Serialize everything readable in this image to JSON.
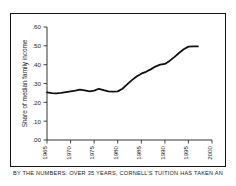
{
  "caption": "BY THE NUMBERS: OVER 35 YEARS, CORNELL'S TUITION HAS TAKEN AN",
  "colors": {
    "line": "#101010",
    "axis": "#1d1d1d",
    "frame": "#161616",
    "background": "#ffffff"
  },
  "chart_data": {
    "type": "line",
    "title": "",
    "xlabel": "",
    "ylabel": "Share of median family income",
    "xlim": [
      1965,
      2000
    ],
    "ylim": [
      0.0,
      0.6
    ],
    "grid": false,
    "legend_position": "none",
    "xticks": [
      "1965",
      "1970",
      "1975",
      "1980",
      "1985",
      "1990",
      "1995",
      "2000"
    ],
    "xtick_values": [
      1965,
      1970,
      1975,
      1980,
      1985,
      1990,
      1995,
      2000
    ],
    "yticks": [
      ".00",
      ".10",
      ".20",
      ".30",
      ".40",
      ".50",
      ".60"
    ],
    "ytick_values": [
      0.0,
      0.1,
      0.2,
      0.3,
      0.4,
      0.5,
      0.6
    ],
    "series": [
      {
        "name": "Cornell tuition as share of median family income",
        "x": [
          1965,
          1966,
          1967,
          1968,
          1969,
          1970,
          1971,
          1972,
          1973,
          1974,
          1975,
          1976,
          1977,
          1978,
          1979,
          1980,
          1981,
          1982,
          1983,
          1984,
          1985,
          1986,
          1987,
          1988,
          1989,
          1990,
          1991,
          1992,
          1993,
          1994,
          1995,
          1996,
          1997
        ],
        "values": [
          0.253,
          0.249,
          0.248,
          0.25,
          0.254,
          0.258,
          0.262,
          0.268,
          0.263,
          0.258,
          0.262,
          0.272,
          0.265,
          0.258,
          0.257,
          0.258,
          0.272,
          0.295,
          0.318,
          0.337,
          0.352,
          0.362,
          0.375,
          0.39,
          0.4,
          0.404,
          0.42,
          0.44,
          0.462,
          0.482,
          0.496,
          0.497,
          0.497
        ]
      }
    ]
  }
}
